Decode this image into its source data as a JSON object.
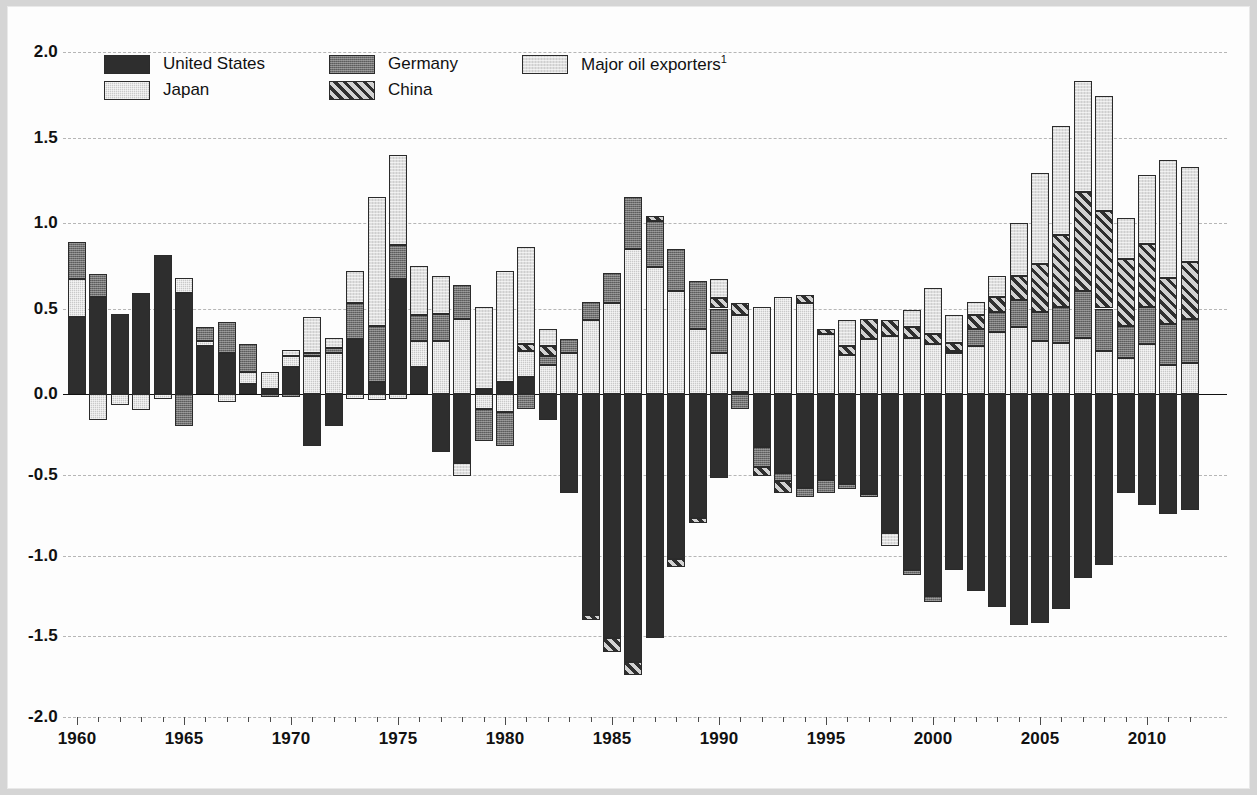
{
  "chart_data": {
    "type": "bar",
    "title": "",
    "subtitle": "",
    "xlabel": "",
    "ylabel": "",
    "stacked": true,
    "grid": true,
    "legend_position": "top-left",
    "ylim": [
      -2.0,
      2.0
    ],
    "ytick_values": [
      2.0,
      1.5,
      1.0,
      0.5,
      0.0,
      -0.5,
      -1.0,
      -1.5,
      -2.0
    ],
    "ytick_labels": [
      "2.0",
      "1.5",
      "1.0",
      "0.5",
      "0.0",
      "-0.5",
      "-1.0",
      "-1.5",
      "-2.0"
    ],
    "xtick_labels": [
      "1960",
      "1965",
      "1970",
      "1975",
      "1980",
      "1985",
      "1990",
      "1995",
      "2000",
      "2005",
      "2010"
    ],
    "xtick_values": [
      1960,
      1965,
      1970,
      1975,
      1980,
      1985,
      1990,
      1995,
      2000,
      2005,
      2010
    ],
    "xlim": [
      1959.4,
      2012.6
    ],
    "categories": [
      1960,
      1961,
      1962,
      1963,
      1964,
      1965,
      1966,
      1967,
      1968,
      1969,
      1970,
      1971,
      1972,
      1973,
      1974,
      1975,
      1976,
      1977,
      1978,
      1979,
      1980,
      1981,
      1982,
      1983,
      1984,
      1985,
      1986,
      1987,
      1988,
      1989,
      1990,
      1991,
      1992,
      1993,
      1994,
      1995,
      1996,
      1997,
      1998,
      1999,
      2000,
      2001,
      2002,
      2003,
      2004,
      2005,
      2006,
      2007,
      2008,
      2009,
      2010,
      2011,
      2012
    ],
    "series": [
      {
        "name": "United States",
        "color": "#2e2e2e",
        "pattern": "solid",
        "values": [
          0.45,
          0.57,
          0.47,
          0.59,
          0.81,
          0.59,
          0.28,
          0.24,
          0.06,
          0.03,
          0.16,
          -0.32,
          -0.2,
          0.32,
          0.07,
          0.67,
          0.16,
          -0.36,
          -0.43,
          0.03,
          0.07,
          0.1,
          -0.16,
          -0.61,
          -1.37,
          -1.51,
          -1.66,
          -1.51,
          -1.02,
          -0.77,
          -0.52,
          0.01,
          -0.33,
          -0.49,
          -0.58,
          -0.53,
          -0.56,
          -0.62,
          -0.85,
          -1.09,
          -1.25,
          -1.09,
          -1.22,
          -1.32,
          -1.43,
          -1.42,
          -1.33,
          -1.14,
          -1.06,
          -0.61,
          -0.69,
          -0.74,
          -0.72
        ]
      },
      {
        "name": "Japan",
        "color": "#c9c9c9",
        "pattern": "fine-dot",
        "values": [
          0.22,
          -0.16,
          -0.07,
          -0.1,
          -0.03,
          0.09,
          0.03,
          -0.05,
          0.07,
          0.1,
          0.06,
          0.22,
          0.24,
          -0.03,
          -0.04,
          -0.03,
          0.15,
          0.31,
          0.44,
          -0.09,
          -0.11,
          0.15,
          0.17,
          0.24,
          0.43,
          0.53,
          0.85,
          0.74,
          0.6,
          0.38,
          0.24,
          0.45,
          0.51,
          0.57,
          0.53,
          0.35,
          0.23,
          0.32,
          0.34,
          0.33,
          0.29,
          0.24,
          0.28,
          0.36,
          0.39,
          0.31,
          0.3,
          0.33,
          0.25,
          0.21,
          0.29,
          0.17,
          0.18
        ]
      },
      {
        "name": "Germany",
        "color": "#717171",
        "pattern": "medium-dot",
        "values": [
          0.22,
          0.13,
          0.0,
          0.0,
          0.0,
          -0.2,
          0.08,
          0.18,
          0.16,
          -0.02,
          -0.02,
          0.02,
          0.03,
          0.21,
          0.33,
          0.2,
          0.15,
          0.16,
          0.2,
          -0.2,
          -0.21,
          -0.09,
          0.05,
          0.08,
          0.11,
          0.18,
          0.3,
          0.27,
          0.25,
          0.28,
          0.26,
          -0.09,
          -0.12,
          -0.05,
          -0.06,
          -0.08,
          -0.03,
          -0.02,
          -0.01,
          -0.03,
          -0.04,
          0.01,
          0.1,
          0.12,
          0.16,
          0.17,
          0.21,
          0.27,
          0.25,
          0.19,
          0.22,
          0.24,
          0.26
        ]
      },
      {
        "name": "China",
        "color": "#d2d2d2",
        "pattern": "diagonal-hatch",
        "values": [
          0.0,
          0.0,
          0.0,
          0.0,
          0.0,
          0.0,
          0.0,
          0.0,
          0.0,
          0.0,
          0.0,
          0.0,
          0.0,
          0.0,
          0.0,
          0.0,
          0.0,
          0.0,
          0.0,
          0.0,
          0.0,
          0.04,
          0.06,
          0.0,
          -0.03,
          -0.09,
          -0.08,
          0.03,
          -0.05,
          -0.03,
          0.06,
          0.07,
          -0.06,
          -0.07,
          0.05,
          0.03,
          0.05,
          0.12,
          0.09,
          0.06,
          0.06,
          0.05,
          0.08,
          0.09,
          0.14,
          0.28,
          0.42,
          0.58,
          0.57,
          0.39,
          0.37,
          0.27,
          0.33
        ]
      },
      {
        "name": "Major oil exporters",
        "color": "#dedede",
        "pattern": "light-dot",
        "values": [
          0.0,
          0.0,
          0.0,
          0.0,
          0.0,
          0.0,
          0.0,
          0.0,
          0.0,
          0.0,
          0.04,
          0.21,
          0.06,
          0.19,
          0.75,
          0.53,
          0.29,
          0.22,
          -0.08,
          0.48,
          0.65,
          0.57,
          0.1,
          0.0,
          0.0,
          0.0,
          0.0,
          0.0,
          0.0,
          0.0,
          0.11,
          0.0,
          0.0,
          0.0,
          0.0,
          0.0,
          0.15,
          0.0,
          -0.08,
          0.1,
          0.27,
          0.16,
          0.08,
          0.12,
          0.31,
          0.53,
          0.64,
          0.65,
          0.67,
          0.24,
          0.4,
          0.69,
          0.56
        ]
      }
    ],
    "note": "Stacked bar chart of global current account balances as percent of world GDP; positive and negative stacks around a zero line."
  },
  "legend": {
    "items": [
      {
        "label": "United States",
        "key": "us"
      },
      {
        "label": "Japan",
        "key": "jp"
      },
      {
        "label": "Germany",
        "key": "de"
      },
      {
        "label": "China",
        "key": "cn"
      },
      {
        "label": "Major oil exporters",
        "key": "oil",
        "superscript": "1"
      }
    ]
  }
}
